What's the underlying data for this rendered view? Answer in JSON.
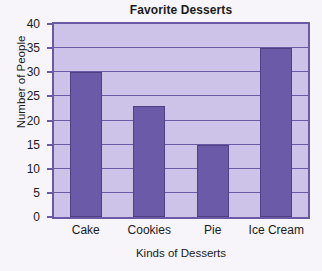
{
  "chart_data": {
    "type": "bar",
    "title": "Favorite Desserts",
    "xlabel": "Kinds of Desserts",
    "ylabel": "Number of People",
    "categories": [
      "Cake",
      "Cookies",
      "Pie",
      "Ice Cream"
    ],
    "values": [
      30,
      23,
      15,
      35
    ],
    "ylim": [
      0,
      40
    ],
    "ytick_step": 5,
    "yticks": [
      0,
      5,
      10,
      15,
      20,
      25,
      30,
      35,
      40
    ],
    "ytick_labels": [
      "0",
      "5",
      "10",
      "15",
      "20",
      "25",
      "30",
      "35",
      "40"
    ],
    "grid": true,
    "legend": false,
    "colors": {
      "bar_fill": "#6b5aa8",
      "bar_edge": "#4e4083",
      "plot_background": "#cdc3e8",
      "grid_line": "#6a5aa6",
      "axis_border": "#6a5aa6",
      "page_background": "#f7f5f9",
      "text": "#1b1b1b"
    }
  }
}
